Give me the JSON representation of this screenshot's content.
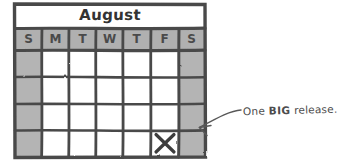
{
  "canvas": {
    "width": 327,
    "height": 165,
    "background": "#ffffff",
    "style": "hand-drawn-sketch"
  },
  "calendar": {
    "title": "August",
    "title_bar_color": "#ffffff",
    "ink_color": "#4a4a4a",
    "weekend_shade": "#b4b4b4",
    "header_shade": "#b0b0b0",
    "weekday_cell_color": "#ffffff",
    "day_headers": [
      {
        "label": "S",
        "weekend": true
      },
      {
        "label": "M",
        "weekend": false
      },
      {
        "label": "T",
        "weekend": false
      },
      {
        "label": "W",
        "weekend": false
      },
      {
        "label": "T",
        "weekend": false
      },
      {
        "label": "F",
        "weekend": false
      },
      {
        "label": "S",
        "weekend": true
      }
    ],
    "rows": 4,
    "columns": 7,
    "marked_cell": {
      "mark": "X",
      "row": 4,
      "column": 6,
      "day_label": "F"
    }
  },
  "annotation": {
    "text_before": "One ",
    "text_emphasis": "BIG",
    "text_after": " release.",
    "full_text": "One BIG release.",
    "pointer": "curved-arrow-left",
    "color": "#4c4c4c"
  }
}
